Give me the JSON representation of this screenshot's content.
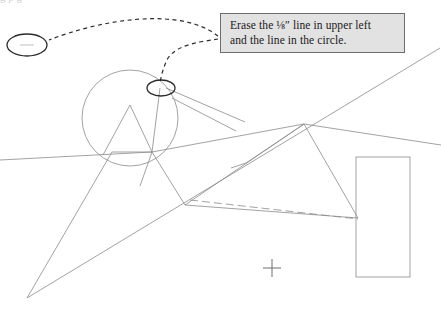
{
  "page": {
    "width": 441,
    "height": 311,
    "background_color": "#ffffff"
  },
  "callout": {
    "name": "annotation-callout",
    "fill_color": "#e2e2e2",
    "border_color": "#6d6d6d",
    "text_color": "#19191a",
    "line1": "Erase the ⅛″ line in upper left",
    "line2": "and the line in the circle.",
    "full_text": "Erase the ⅛″ line in upper left and the line in the circle."
  },
  "top_cropped_text": {
    "fragment": "g  p g"
  },
  "drawing": {
    "stroke_color": "#8a8a8c",
    "annotation_stroke_color": "#2b2b2d",
    "leader_style": "dashed",
    "markers": [
      {
        "name": "upper-left-ellipse-marker",
        "cx": 27,
        "cy": 45,
        "rx": 20,
        "ry": 11,
        "note": "ellipse circling the 1/8 inch line in upper left"
      },
      {
        "name": "circle-interior-ellipse-marker",
        "cx": 161,
        "cy": 88,
        "rx": 14,
        "ry": 8,
        "note": "ellipse circling the line inside the circle"
      }
    ],
    "shapes": [
      {
        "name": "main-circle",
        "cx": 130,
        "cy": 118,
        "r": 48
      },
      {
        "name": "right-rectangle",
        "x": 356,
        "y": 157,
        "width": 54,
        "height": 120
      },
      {
        "name": "crosshair-mark",
        "cx": 272,
        "cy": 268,
        "size": 18
      }
    ],
    "leader_curves": [
      {
        "name": "leader-to-upper-left-marker",
        "from": [
          220,
          36
        ],
        "to": [
          49,
          40
        ]
      },
      {
        "name": "leader-to-circle-marker",
        "from": [
          220,
          38
        ],
        "to": [
          161,
          84
        ]
      }
    ]
  }
}
